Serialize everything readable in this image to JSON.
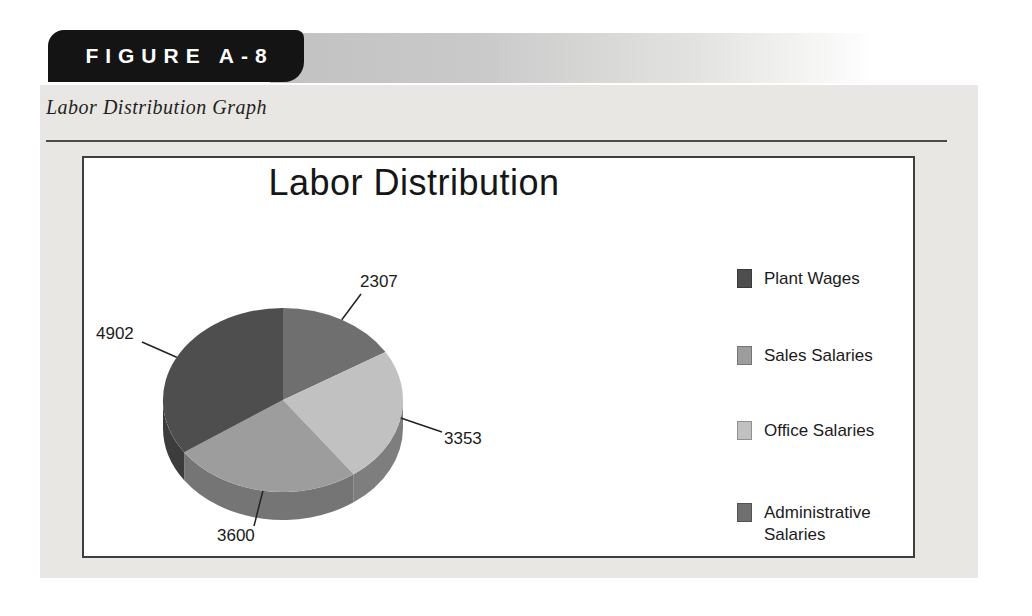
{
  "figure": {
    "tag_label": "FIGURE A-8",
    "caption": "Labor Distribution Graph"
  },
  "colors": {
    "page_bg": "#e8e7e4",
    "tab_bg": "#141414",
    "tab_text": "#ffffff",
    "rule": "#4b4b4b",
    "box_border": "#3e3e3e",
    "box_bg": "#ffffff",
    "text": "#1b1b1b"
  },
  "chart_data": {
    "type": "pie",
    "style": "3d",
    "title": "Labor Distribution",
    "legend_position": "right",
    "categories": [
      "Plant Wages",
      "Sales Salaries",
      "Office Salaries",
      "Administrative Salaries"
    ],
    "values": [
      4902,
      3600,
      3353,
      2307
    ],
    "total": 14162,
    "slice_colors": [
      "#4e4e4e",
      "#9d9d9d",
      "#c1c1c1",
      "#6f6f6f"
    ],
    "side_colors": [
      "#3c3c3c",
      "#757575",
      "#7e7e7e",
      "#4f4f4f"
    ],
    "data_labels": [
      "4902",
      "3600",
      "3353",
      "2307"
    ],
    "draw_order_clockwise_from_top": [
      3,
      2,
      1,
      0
    ],
    "legend_entries": [
      "Plant Wages",
      "Sales Salaries",
      "Office Salaries",
      "Administrative Salaries"
    ]
  }
}
